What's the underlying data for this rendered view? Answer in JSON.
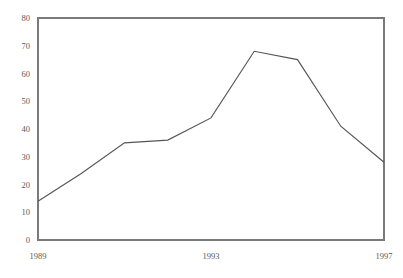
{
  "chart_data": {
    "type": "line",
    "title": "",
    "subtitle": "",
    "xlabel": "",
    "ylabel": "",
    "x": [
      1989,
      1990,
      1991,
      1992,
      1993,
      1994,
      1995,
      1996,
      1997
    ],
    "values": [
      14,
      24,
      35,
      36,
      44,
      68,
      65,
      41,
      28
    ],
    "series": [
      {
        "name": "",
        "values": [
          14,
          24,
          35,
          36,
          44,
          68,
          65,
          41,
          28
        ]
      }
    ],
    "xlim": [
      1989,
      1997
    ],
    "ylim": [
      0,
      80
    ],
    "ytick_values": [
      0,
      10,
      20,
      30,
      40,
      50,
      60,
      70,
      80
    ],
    "ytick_labels": [
      "0",
      "10",
      "20",
      "30",
      "40",
      "50",
      "60",
      "70",
      "80"
    ],
    "xtick_values": [
      1989,
      1993,
      1997
    ],
    "xtick_labels": [
      "1989",
      "1993",
      "1997"
    ],
    "grid": false,
    "legend": false,
    "legend_position": "none",
    "annotations": [],
    "colors": {
      "line": "#55555a",
      "axis": "#6e6e6e",
      "frame": "#7a7a7a",
      "tick_text": "#5a5a5a",
      "background": "#ffffff"
    }
  },
  "plot_geometry": {
    "left": 38,
    "right": 384,
    "top": 18,
    "bottom": 240
  }
}
